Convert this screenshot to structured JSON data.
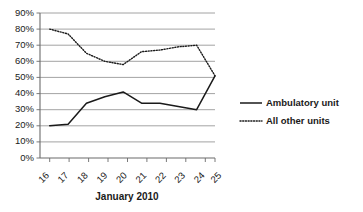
{
  "chart_data": {
    "type": "line",
    "title": "",
    "xlabel": "January 2010",
    "ylabel": "",
    "categories": [
      "16",
      "17",
      "18",
      "19",
      "20",
      "21",
      "22",
      "23",
      "24",
      "25"
    ],
    "ylim": [
      0,
      90
    ],
    "ytick_labels": [
      "0%",
      "10%",
      "20%",
      "30%",
      "40%",
      "50%",
      "60%",
      "70%",
      "80%",
      "90%"
    ],
    "ytick_values": [
      0,
      10,
      20,
      30,
      40,
      50,
      60,
      70,
      80,
      90
    ],
    "grid": true,
    "legend_position": "right",
    "series": [
      {
        "name": "Ambulatory unit",
        "style": "solid",
        "color": "#1a1a1a",
        "values": [
          20,
          21,
          34,
          38,
          41,
          34,
          34,
          32,
          30,
          51
        ]
      },
      {
        "name": "All other units",
        "style": "dotted",
        "color": "#1a1a1a",
        "values": [
          80,
          77,
          65,
          60,
          58,
          66,
          67,
          69,
          70,
          51
        ]
      }
    ]
  },
  "legend": {
    "items": [
      {
        "label": "Ambulatory unit",
        "style": "solid"
      },
      {
        "label": "All other units",
        "style": "dotted"
      }
    ]
  },
  "axis": {
    "x_title": "January 2010"
  }
}
